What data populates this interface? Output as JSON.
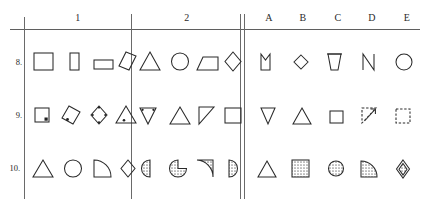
{
  "test_sheet": {
    "kind": "non-verbal-reasoning-figure-matrix",
    "header": {
      "problem_columns": [
        {
          "label": "1"
        },
        {
          "label": "2"
        }
      ],
      "answer_columns": [
        {
          "label": "A"
        },
        {
          "label": "B"
        },
        {
          "label": "C"
        },
        {
          "label": "D"
        },
        {
          "label": "E"
        }
      ]
    },
    "rows": [
      {
        "number": "8.",
        "problems": {
          "1": [
            {
              "shape": "square-outline"
            },
            {
              "shape": "tall-narrow-rectangle-outline"
            },
            {
              "shape": "wide-flat-rectangle-outline"
            },
            {
              "shape": "tilted-rhombus-outline"
            }
          ],
          "2": [
            {
              "shape": "triangle-outline"
            },
            {
              "shape": "circle-outline"
            },
            {
              "shape": "trapezoid-outline"
            },
            {
              "shape": "diamond-outline"
            }
          ]
        },
        "answers": [
          {
            "option": "A",
            "shape": "square-with-v-notch-top"
          },
          {
            "option": "B",
            "shape": "small-diamond-outline"
          },
          {
            "option": "C",
            "shape": "inverted-trapezoid-cup-outline"
          },
          {
            "option": "D",
            "shape": "letter-n-open-shape"
          },
          {
            "option": "E",
            "shape": "circle-outline"
          }
        ]
      },
      {
        "number": "9.",
        "problems": {
          "1": [
            {
              "shape": "small-square-with-corner-dot"
            },
            {
              "shape": "tilted-rhombus-with-dot"
            },
            {
              "shape": "diamond-with-vertex-dots"
            },
            {
              "shape": "triangle-with-inner-dot"
            }
          ],
          "2": [
            {
              "shape": "inverted-triangle-with-dots"
            },
            {
              "shape": "triangle-outline"
            },
            {
              "shape": "right-triangle-outline"
            },
            {
              "shape": "square-outline"
            }
          ]
        },
        "answers": [
          {
            "option": "A",
            "shape": "inverted-triangle-outline"
          },
          {
            "option": "B",
            "shape": "triangle-outline"
          },
          {
            "option": "C",
            "shape": "small-square-outline"
          },
          {
            "option": "D",
            "shape": "dashed-right-triangle-with-arrow"
          },
          {
            "option": "E",
            "shape": "dashed-square"
          }
        ]
      },
      {
        "number": "10.",
        "problems": {
          "1": [
            {
              "shape": "triangle-outline"
            },
            {
              "shape": "circle-outline"
            },
            {
              "shape": "quarter-circle-outline"
            },
            {
              "shape": "diamond-outline"
            }
          ],
          "2": [
            {
              "shape": "shaded-half-circle-left"
            },
            {
              "shape": "shaded-circle-with-notch"
            },
            {
              "shape": "shaded-quarter-circle"
            },
            {
              "shape": "shaded-half-circle-right"
            }
          ]
        },
        "answers": [
          {
            "option": "A",
            "shape": "triangle-outline"
          },
          {
            "option": "B",
            "shape": "shaded-square"
          },
          {
            "option": "C",
            "shape": "shaded-circle"
          },
          {
            "option": "D",
            "shape": "shaded-quarter-circle"
          },
          {
            "option": "E",
            "shape": "diamond-with-shaded-core"
          }
        ]
      }
    ],
    "colors": {
      "ink": "#2a2a2a",
      "rule": "#5f5f5f",
      "shading": "#9a9a9a",
      "paper": "#ffffff"
    }
  }
}
